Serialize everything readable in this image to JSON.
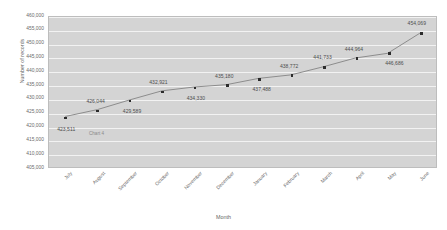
{
  "chart_data": {
    "type": "line",
    "title": "",
    "xlabel": "Month",
    "ylabel": "Number of records",
    "watermark": "Chart 4",
    "categories": [
      "July",
      "August",
      "September",
      "October",
      "November",
      "December",
      "January",
      "February",
      "March",
      "April",
      "May",
      "June"
    ],
    "values": [
      423511,
      426044,
      429589,
      432921,
      434330,
      435180,
      437488,
      438772,
      441733,
      444964,
      446686,
      454069
    ],
    "point_labels": [
      "423,511",
      "426,044",
      "429,589",
      "432,921",
      "434,330",
      "435,180",
      "437,488",
      "438,772",
      "441,733",
      "444,964",
      "446,686",
      "454,069"
    ],
    "ylim": [
      405000,
      460000
    ],
    "ytick_step": 5000,
    "ytick_labels": [
      "460,000",
      "455,000",
      "450,000",
      "445,000",
      "440,000",
      "435,000",
      "430,000",
      "425,000",
      "420,000",
      "415,000",
      "410,000",
      "405,000"
    ],
    "ytick_values": [
      460000,
      455000,
      450000,
      445000,
      440000,
      435000,
      430000,
      425000,
      420000,
      415000,
      410000,
      405000
    ],
    "grid": true,
    "legend": "none",
    "series_name": "",
    "colors": {
      "plot_background": "#d4d4d4",
      "gridline": "#f2f2f2",
      "line": "#8c8c8c",
      "marker": "#2b2b2b",
      "label_text": "#4d4d4d",
      "axis_text": "#6b6b6b",
      "plot_border": "#bdbdbd",
      "page_background": "#ffffff"
    },
    "label_offsets": [
      {
        "dx": 2,
        "dy": 12
      },
      {
        "dx": -1,
        "dy": -9
      },
      {
        "dx": 3,
        "dy": 11
      },
      {
        "dx": -3,
        "dy": -9
      },
      {
        "dx": 2,
        "dy": 11
      },
      {
        "dx": -2,
        "dy": -9
      },
      {
        "dx": 3,
        "dy": 11
      },
      {
        "dx": -2,
        "dy": -9
      },
      {
        "dx": -1,
        "dy": -9
      },
      {
        "dx": -2,
        "dy": -9
      },
      {
        "dx": 6,
        "dy": 10
      },
      {
        "dx": -4,
        "dy": -9
      }
    ]
  }
}
